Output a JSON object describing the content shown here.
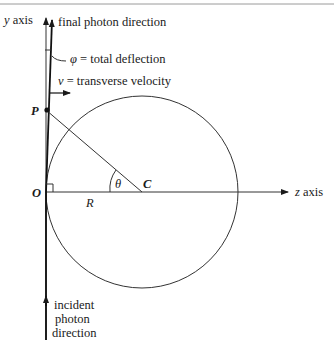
{
  "diagram": {
    "labels": {
      "y_axis_var": "y",
      "y_axis_word": " axis",
      "z_axis_var": "z",
      "z_axis_word": " axis",
      "final_direction": "final photon direction",
      "phi_symbol": "φ",
      "phi_text": " = total deflection",
      "v_symbol": "v",
      "v_text": " = transverse velocity",
      "point_P": "P",
      "point_O": "O",
      "point_C": "C",
      "radius": "R",
      "theta": "θ",
      "incident_line1": "incident",
      "incident_line2": "photon",
      "incident_line3": "direction"
    },
    "colors": {
      "line": "#2a2a2a",
      "photon": "#111111",
      "border": "#9a9a9a"
    }
  }
}
